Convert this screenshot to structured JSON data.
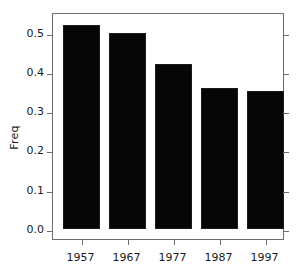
{
  "chart_data": {
    "type": "bar",
    "title": "",
    "subtitle": "",
    "xlabel": "",
    "ylabel": "Freq",
    "categories": [
      "1957",
      "1967",
      "1977",
      "1987",
      "1997"
    ],
    "values": [
      0.52,
      0.5,
      0.42,
      0.36,
      0.35
    ],
    "series": [
      {
        "name": "Freq",
        "values": [
          0.52,
          0.5,
          0.42,
          0.36,
          0.35
        ]
      }
    ],
    "ylim": [
      0.0,
      0.55
    ],
    "xlim_note": "categorical",
    "ytick_labels": [
      "0.0",
      "0.1",
      "0.2",
      "0.3",
      "0.4",
      "0.5"
    ],
    "ytick_values": [
      0.0,
      0.1,
      0.2,
      0.3,
      0.4,
      0.5
    ],
    "xtick_labels": [
      "1957",
      "1967",
      "1977",
      "1987",
      "1997"
    ],
    "grid": false,
    "legend": null,
    "legend_position": "none",
    "annotations": [],
    "bar_color": "#060606",
    "axis_color": "#6e6e6e",
    "background_color": "#ffffff",
    "ticks_both_sides": true
  },
  "axis": {
    "y_title": "Freq"
  }
}
